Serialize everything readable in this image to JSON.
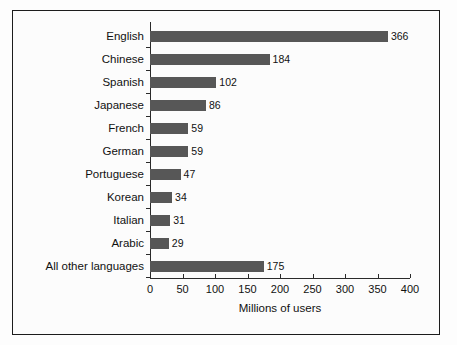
{
  "chart_data": {
    "type": "bar",
    "orientation": "horizontal",
    "title": "",
    "xlabel": "Millions of users",
    "ylabel": "",
    "xlim": [
      0,
      400
    ],
    "ylim": null,
    "grid": false,
    "legend": null,
    "xticks": [
      0,
      50,
      100,
      150,
      200,
      250,
      300,
      350,
      400
    ],
    "xtick_labels": [
      "0",
      "50",
      "100",
      "150",
      "200",
      "250",
      "300",
      "350",
      "400"
    ],
    "categories": [
      "English",
      "Chinese",
      "Spanish",
      "Japanese",
      "French",
      "German",
      "Portuguese",
      "Korean",
      "Italian",
      "Arabic",
      "All other languages"
    ],
    "values": [
      366,
      184,
      102,
      86,
      59,
      59,
      47,
      34,
      31,
      29,
      175
    ],
    "data_labels": [
      "366",
      "184",
      "102",
      "86",
      "59",
      "59",
      "47",
      "34",
      "31",
      "29",
      "175"
    ],
    "bar_color": "#575757",
    "axis_color": "#2a2a2a",
    "text_color": "#111111",
    "background_color": "#fcfcfc",
    "frame_color": "#1c1c1c"
  }
}
